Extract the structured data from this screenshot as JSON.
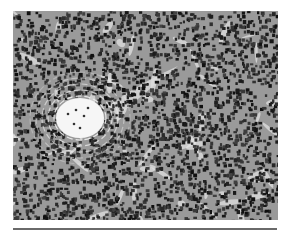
{
  "figure": {
    "palette": {
      "background": "#ffffff",
      "tissue_base": "#8e8e8e",
      "nucleus": "#1e1e1e",
      "stroma": "#e6e6e6",
      "rule": "#6a6a6a"
    },
    "corpuscle_center": [
      67,
      107
    ],
    "corpuscle_radius": 26
  }
}
